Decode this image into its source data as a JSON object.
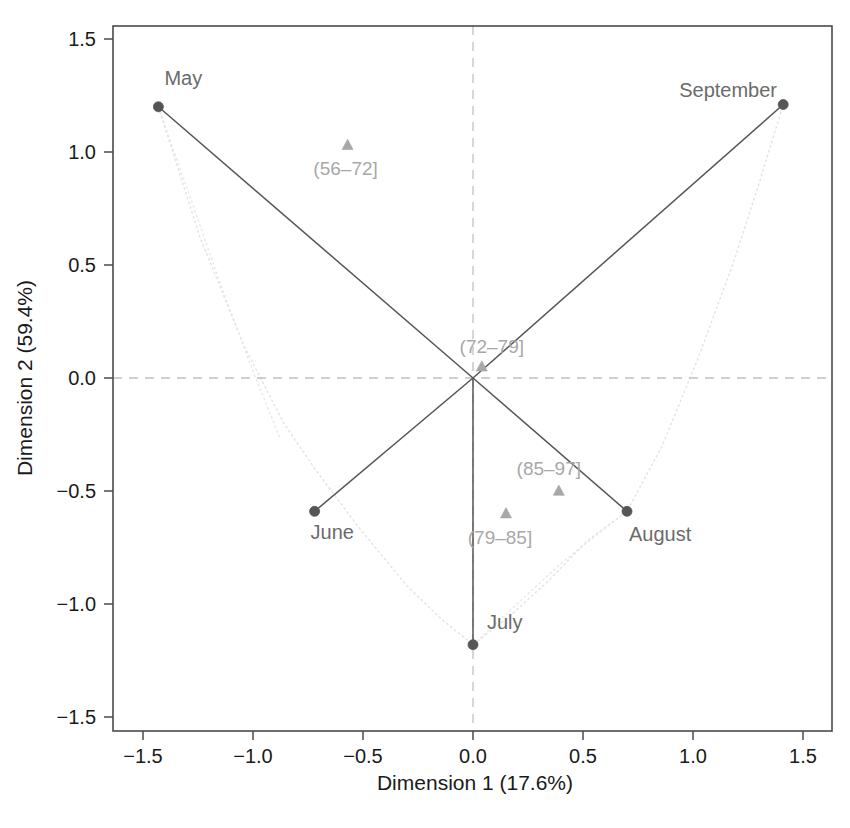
{
  "chart_data": {
    "type": "scatter",
    "title": "",
    "subtitle": "",
    "xlabel": "Dimension 1 (17.6%)",
    "ylabel": "Dimension 2 (59.4%)",
    "xlim": [
      -1.62,
      1.62
    ],
    "ylim": [
      -1.62,
      1.62
    ],
    "xticks": [
      "-1.5",
      "-1.0",
      "-0.5",
      "0.0",
      "0.5",
      "1.0",
      "1.5"
    ],
    "xtick_values": [
      -1.5,
      -1.0,
      -0.5,
      0.0,
      0.5,
      1.0,
      1.5
    ],
    "yticks": [
      "1.5",
      "1.0",
      "0.5",
      "0.0",
      "-0.5",
      "-1.0",
      "-1.5"
    ],
    "ytick_values": [
      1.5,
      1.0,
      0.5,
      0.0,
      -0.5,
      -1.0,
      -1.5
    ],
    "grid": false,
    "reference_lines": [
      {
        "axis": "horizontal",
        "value": 0.0,
        "style": "dashed",
        "color": "#c0c0c0"
      },
      {
        "axis": "vertical",
        "value": 0.0,
        "style": "dashed",
        "color": "#c0c0c0"
      }
    ],
    "legend": "none",
    "legend_position": "none",
    "series": [
      {
        "name": "Months",
        "marker": "circle",
        "color": "#555555",
        "points": [
          {
            "label": "May",
            "x": -1.43,
            "y": 1.2,
            "label_dx": 6,
            "label_dy": -22
          },
          {
            "label": "June",
            "x": -0.72,
            "y": -0.59,
            "label_dx": -4,
            "label_dy": 28
          },
          {
            "label": "July",
            "x": 0.0,
            "y": -1.18,
            "label_dx": 14,
            "label_dy": -16
          },
          {
            "label": "August",
            "x": 0.7,
            "y": -0.59,
            "label_dx": 2,
            "label_dy": 30
          },
          {
            "label": "September",
            "x": 1.41,
            "y": 1.21,
            "label_dx": -104,
            "label_dy": -8
          }
        ]
      },
      {
        "name": "Ozone categories",
        "marker": "triangle",
        "color": "#a8a8a8",
        "points": [
          {
            "label": "(56–72]",
            "x": -0.57,
            "y": 1.03,
            "label_dx": -2,
            "label_dy": 30
          },
          {
            "label": "(72–79]",
            "x": 0.04,
            "y": 0.05,
            "label_dx": 10,
            "label_dy": -14
          },
          {
            "label": "(79–85]",
            "x": 0.15,
            "y": -0.6,
            "label_dx": -6,
            "label_dy": 30
          },
          {
            "label": "(85–97]",
            "x": 0.39,
            "y": -0.5,
            "label_dx": -10,
            "label_dy": -16
          }
        ]
      }
    ],
    "connector_lines": [
      {
        "from": [
          0,
          0
        ],
        "to": [
          -1.43,
          1.2
        ],
        "color": "#555555",
        "style": "solid"
      },
      {
        "from": [
          0,
          0
        ],
        "to": [
          -0.72,
          -0.59
        ],
        "color": "#555555",
        "style": "solid"
      },
      {
        "from": [
          0,
          0
        ],
        "to": [
          0.0,
          -1.18
        ],
        "color": "#555555",
        "style": "solid"
      },
      {
        "from": [
          0,
          0
        ],
        "to": [
          0.7,
          -0.59
        ],
        "color": "#555555",
        "style": "solid"
      },
      {
        "from": [
          0,
          0
        ],
        "to": [
          1.41,
          1.21
        ],
        "color": "#555555",
        "style": "solid"
      }
    ],
    "dotted_envelope": {
      "color": "#e2e2e2",
      "style": "dotted",
      "points": [
        [
          -1.43,
          1.2
        ],
        [
          -1.24,
          0.62
        ],
        [
          -1.04,
          0.14
        ],
        [
          -0.86,
          -0.2
        ],
        [
          -0.72,
          -0.4
        ],
        [
          -0.52,
          -0.66
        ],
        [
          -0.3,
          -0.92
        ],
        [
          -0.14,
          -1.07
        ],
        [
          0.0,
          -1.18
        ],
        [
          0.16,
          -1.06
        ],
        [
          0.34,
          -0.9
        ],
        [
          0.52,
          -0.72
        ],
        [
          0.7,
          -0.59
        ],
        [
          0.86,
          -0.3
        ],
        [
          1.02,
          0.08
        ],
        [
          1.18,
          0.5
        ],
        [
          1.3,
          0.86
        ],
        [
          1.41,
          1.21
        ]
      ]
    },
    "extra_dotted_segments": [
      {
        "points": [
          [
            -1.43,
            1.2
          ],
          [
            -1.3,
            0.84
          ],
          [
            -1.16,
            0.45
          ],
          [
            -1.02,
            0.08
          ],
          [
            -0.88,
            -0.26
          ]
        ],
        "color": "#e6e6e6"
      },
      {
        "points": [
          [
            0.0,
            -1.18
          ],
          [
            0.2,
            -1.0
          ],
          [
            0.4,
            -0.82
          ],
          [
            0.58,
            -0.68
          ],
          [
            0.7,
            -0.59
          ]
        ],
        "color": "#e6e6e6"
      }
    ]
  },
  "axes": {
    "x_title": "Dimension 1 (17.6%)",
    "y_title": "Dimension 2 (59.4%)",
    "x_tick_labels": [
      "−1.5",
      "−1.0",
      "−0.5",
      "0.0",
      "0.5",
      "1.0",
      "1.5"
    ],
    "y_tick_labels": [
      "1.5",
      "1.0",
      "0.5",
      "0.0",
      "−0.5",
      "−1.0",
      "−1.5"
    ]
  },
  "colors": {
    "month_marker": "#555555",
    "category_marker": "#a8a8a8",
    "connector": "#555555",
    "envelope": "#e2e2e2",
    "reference_line": "#c8c8c8",
    "frame": "#4a4a4a",
    "tick_text": "#1a1a1a",
    "month_label": "#6b6b6b",
    "category_label": "#a8a8a8",
    "background": "#ffffff"
  }
}
